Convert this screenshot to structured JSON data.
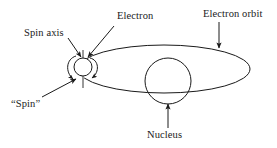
{
  "figure": {
    "background_color": "#ffffff",
    "stroke_color": "#1a1a1a",
    "axis_color": "#9a9a9a",
    "width": 277,
    "height": 148
  },
  "labels": {
    "spin_axis": "Spin axis",
    "electron": "Electron",
    "electron_orbit": "Electron orbit",
    "spin": "“Spin”",
    "nucleus": "Nucleus"
  },
  "shapes": {
    "orbit_ellipse": {
      "cx": 164,
      "cy": 69,
      "rx": 86,
      "ry": 24
    },
    "nucleus_circle": {
      "cx": 168,
      "cy": 81,
      "r": 23
    },
    "electron_circle": {
      "cx": 83,
      "cy": 67,
      "r": 9
    },
    "spin_axis_line": {
      "x": 83,
      "y1": 50,
      "y2": 88
    }
  },
  "leaders": {
    "spin_axis_arrow": "from label down-right to electron top-left",
    "electron_arrow": "from label down-left to electron top-right",
    "orbit_arrow": "vertical down to ellipse top-right",
    "spin_arrow": "from label up-right to lower-left spin arc",
    "nucleus_arrow": "vertical up to nucleus bottom"
  }
}
